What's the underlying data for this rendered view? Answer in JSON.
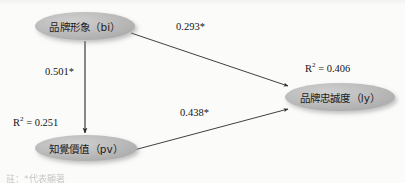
{
  "diagram": {
    "background_color": "#fbfbfa",
    "node_fill_color": "#b9b9b9",
    "node_text_color": "#1d1d1d",
    "arrow_color": "#2a2a2a",
    "nodes": [
      {
        "id": "bi",
        "label": "品牌形象（bi）",
        "cx": 85,
        "cy": 26,
        "rx": 50,
        "ry": 14
      },
      {
        "id": "pv",
        "label": "知覺價值（pv）",
        "cx": 86,
        "cy": 148,
        "rx": 51,
        "ry": 13,
        "rsq_value": "0.251",
        "rsq_prefix": "R",
        "rsq_exponent": "2",
        "rsq_equals": " = "
      },
      {
        "id": "ly",
        "label": "品牌忠誠度（ly）",
        "cx": 340,
        "cy": 97,
        "rx": 55,
        "ry": 14,
        "rsq_value": "0.406",
        "rsq_prefix": "R",
        "rsq_exponent": "2",
        "rsq_equals": " = "
      }
    ],
    "edges": [
      {
        "id": "bi-ly",
        "from": "bi",
        "to": "ly",
        "label": "0.293*"
      },
      {
        "id": "bi-pv",
        "from": "bi",
        "to": "pv",
        "label": "0.501*"
      },
      {
        "id": "pv-ly",
        "from": "pv",
        "to": "ly",
        "label": "0.438*"
      }
    ],
    "footnote": "註：*代表顯著"
  }
}
